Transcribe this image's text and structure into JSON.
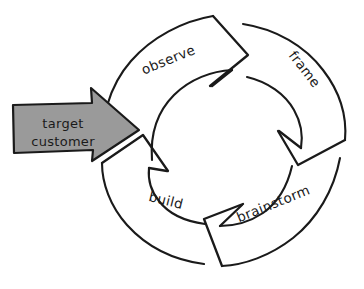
{
  "diagram": {
    "style": "hand-drawn sketch",
    "background_color": "#ffffff",
    "ink_color": "#1a1a1a",
    "cycle": {
      "direction": "counterclockwise",
      "center_x": 216,
      "center_y": 142,
      "inner_radius": 66,
      "outer_radius": 116,
      "steps": [
        {
          "id": "observe",
          "label": "observe",
          "label_x": 170,
          "label_y": 64,
          "label_rotation": -22,
          "order": 1
        },
        {
          "id": "frame",
          "label": "frame",
          "label_x": 301,
          "label_y": 72,
          "label_rotation": 52,
          "order": 2
        },
        {
          "id": "brainstorm",
          "label": "brainstorm",
          "label_x": 275,
          "label_y": 208,
          "label_rotation": -22,
          "order": 3
        },
        {
          "id": "build",
          "label": "build",
          "label_x": 165,
          "label_y": 205,
          "label_rotation": 14,
          "order": 4
        }
      ]
    },
    "entry_arrow": {
      "line_1": "target",
      "line_2": "customer",
      "fill_color": "#9a9a9a",
      "stroke_color": "#1a1a1a",
      "points_to": "observe",
      "direction": "right"
    }
  }
}
